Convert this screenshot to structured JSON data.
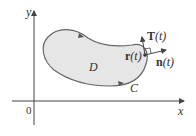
{
  "diagram": {
    "type": "region-with-boundary-curve",
    "axes": {
      "x_label": "x",
      "y_label": "y",
      "origin_label": "0"
    },
    "region": {
      "label": "D",
      "fill": "#e6e6e6",
      "stroke": "#666666"
    },
    "curve": {
      "label": "C",
      "orientation": "counterclockwise"
    },
    "point": {
      "label_bold": "r",
      "label_arg": "(t)"
    },
    "tangent": {
      "label_bold": "T",
      "label_arg": "(t)"
    },
    "normal": {
      "label_bold": "n",
      "label_arg": "(t)"
    },
    "colors": {
      "axis": "#444444",
      "text": "#333333"
    }
  }
}
